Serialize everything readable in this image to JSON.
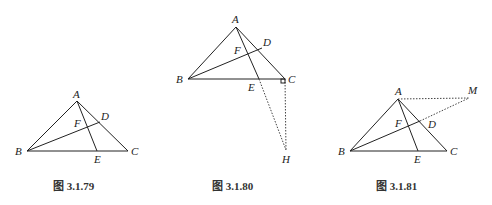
{
  "figures": [
    {
      "caption": "图 3.1.79",
      "labels": {
        "A": "A",
        "B": "B",
        "C": "C",
        "D": "D",
        "E": "E",
        "F": "F"
      }
    },
    {
      "caption": "图 3.1.80",
      "labels": {
        "A": "A",
        "B": "B",
        "C": "C",
        "D": "D",
        "E": "E",
        "F": "F",
        "H": "H"
      }
    },
    {
      "caption": "图 3.1.81",
      "labels": {
        "A": "A",
        "B": "B",
        "C": "C",
        "D": "D",
        "E": "E",
        "F": "F",
        "M": "M"
      }
    }
  ]
}
